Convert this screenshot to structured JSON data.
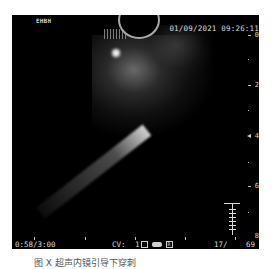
{
  "header": {
    "logo": "EHBH",
    "datetime": "01/09/2021  09:26:11"
  },
  "depth_scale": {
    "labels": [
      "0",
      "2",
      "4",
      "6",
      "8"
    ],
    "unit_marker": "depth-cm"
  },
  "footer": {
    "elapsed": "0:58/3:00",
    "cv_label": "CV:",
    "cv_value": "1",
    "frame_counter": "17/",
    "frame_total": "69"
  },
  "icons": {
    "box": "square-icon",
    "pill": "capsule-icon",
    "r": "R"
  },
  "caption": "图 X  超声内镜引导下穿刺"
}
